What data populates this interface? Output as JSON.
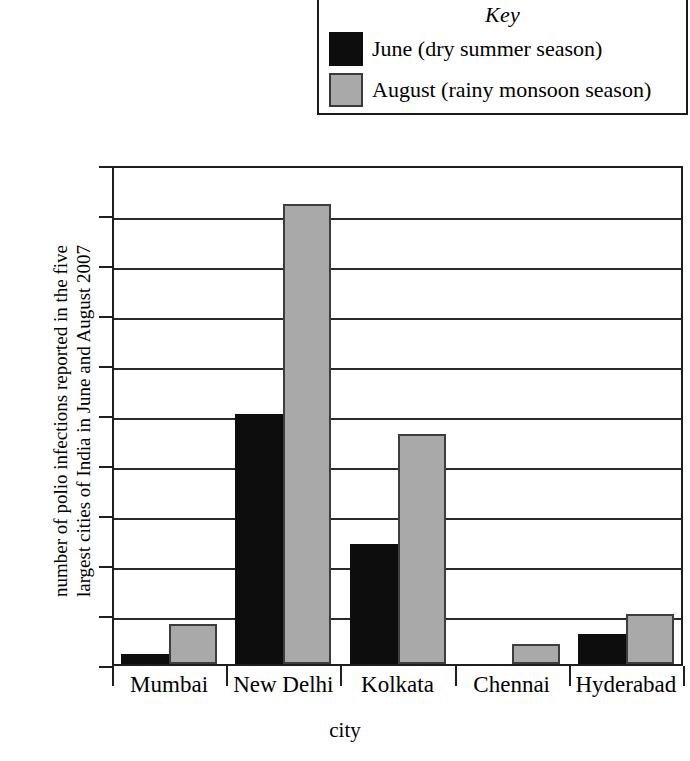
{
  "legend": {
    "title": "Key",
    "entries": [
      {
        "label": "June (dry summer season)",
        "color": "#0d0d0d",
        "swatch": "june-swatch"
      },
      {
        "label": "August (rainy monsoon season)",
        "color": "#a9a9a9",
        "swatch": "august-swatch"
      }
    ]
  },
  "axis": {
    "ylabel_line1": "number of polio infections reported in the five",
    "ylabel_line2": "largest cities of India in June and August 2007",
    "xlabel": "city",
    "yticks": [
      "50",
      "45",
      "40",
      "35",
      "30",
      "25",
      "20",
      "15",
      "10",
      "5",
      "0"
    ]
  },
  "chart_data": {
    "type": "bar",
    "title": "",
    "xlabel": "city",
    "ylabel": "number of polio infections reported in the five largest cities of India in June and August 2007",
    "categories": [
      "Mumbai",
      "New Delhi",
      "Kolkata",
      "Chennai",
      "Hyderabad"
    ],
    "series": [
      {
        "name": "June (dry summer season)",
        "color": "#0d0d0d",
        "values": [
          1,
          25,
          12,
          0,
          3
        ]
      },
      {
        "name": "August (rainy monsoon season)",
        "color": "#a9a9a9",
        "values": [
          4,
          46,
          23,
          2,
          5
        ]
      }
    ],
    "ylim": [
      0,
      50
    ],
    "ytick_step": 5,
    "grid": true,
    "legend_position": "top-right",
    "legend_title": "Key"
  }
}
